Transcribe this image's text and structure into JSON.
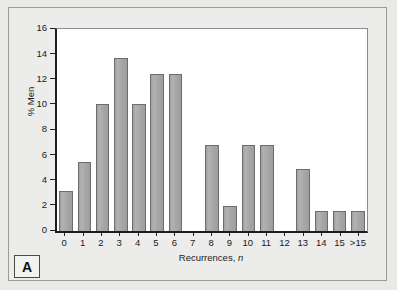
{
  "panel": {
    "letter": "A"
  },
  "chart_data": {
    "type": "bar",
    "title": "",
    "xlabel": "Recurrences, n",
    "xlabel_text": "Recurrences, ",
    "xlabel_italic": "n",
    "ylabel": "% Men",
    "categories": [
      "0",
      "1",
      "2",
      "3",
      "4",
      "5",
      "6",
      "7",
      "8",
      "9",
      "10",
      "11",
      "12",
      "13",
      "14",
      "15",
      ">15"
    ],
    "values": [
      3.2,
      5.5,
      10.1,
      13.7,
      10.1,
      12.4,
      12.4,
      0,
      6.8,
      2.0,
      6.8,
      6.8,
      0,
      4.9,
      1.55,
      1.55,
      1.55
    ],
    "ylim": [
      0,
      16
    ],
    "yticks": [
      0,
      2,
      4,
      6,
      8,
      10,
      12,
      14,
      16
    ],
    "ytick_labels": [
      "0",
      "2",
      "4",
      "6",
      "8",
      "10",
      "12",
      "14",
      "16"
    ],
    "grid": false,
    "legend": null,
    "bar_color": "#a9a9a9",
    "bar_edge_color": "#6d6d6d",
    "axis_color": "#1d1d1d",
    "plot_background": "#ffffff",
    "figure_background": "#ececeb"
  }
}
